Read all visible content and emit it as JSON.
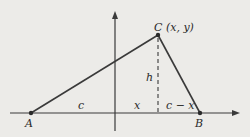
{
  "diagram": {
    "title": "",
    "points": {
      "A": {
        "label": "A",
        "x": 31,
        "y": 113
      },
      "B": {
        "label": "B",
        "x": 200,
        "y": 113
      },
      "C": {
        "label": "C (x, y)",
        "x": 158,
        "y": 35
      }
    },
    "segment_labels": {
      "c": "c",
      "x": "x",
      "c_minus_x": "c − x",
      "h": "h"
    },
    "colors": {
      "line": "#3a3a3a",
      "background": "#ecebe8"
    }
  }
}
